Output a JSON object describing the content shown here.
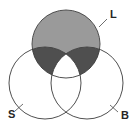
{
  "diagram": {
    "type": "venn-3-set",
    "background_color": "#ffffff",
    "outline_color": "#3c3c3c",
    "fill_light": "#9a9a9a",
    "fill_dark": "#4f4f4f",
    "fill_none": "#ffffff",
    "sets": [
      {
        "key": "L",
        "label": "L",
        "position": "top",
        "cx": 66,
        "cy": 44,
        "r": 34,
        "filled": true
      },
      {
        "key": "S",
        "label": "S",
        "position": "bottom-left",
        "cx": 45,
        "cy": 83,
        "r": 36,
        "filled": false
      },
      {
        "key": "B",
        "label": "B",
        "position": "bottom-right",
        "cx": 87,
        "cy": 83,
        "r": 36,
        "filled": false
      }
    ],
    "regions": [
      {
        "name": "L-only",
        "shading": "light",
        "color": "#9a9a9a"
      },
      {
        "name": "L-and-S-only",
        "shading": "dark",
        "color": "#4f4f4f"
      },
      {
        "name": "L-and-B-only",
        "shading": "dark",
        "color": "#4f4f4f"
      },
      {
        "name": "L-and-S-and-B",
        "shading": "none",
        "color": "#ffffff"
      },
      {
        "name": "S-only",
        "shading": "none",
        "color": "#ffffff"
      },
      {
        "name": "B-only",
        "shading": "none",
        "color": "#ffffff"
      },
      {
        "name": "S-and-B-only",
        "shading": "none",
        "color": "#ffffff"
      }
    ],
    "labels": [
      {
        "key": "L",
        "text": "L",
        "x": 110,
        "y": 15
      },
      {
        "key": "S",
        "text": "S",
        "x": 8,
        "y": 115
      },
      {
        "key": "B",
        "text": "B",
        "x": 121,
        "y": 116
      }
    ]
  }
}
